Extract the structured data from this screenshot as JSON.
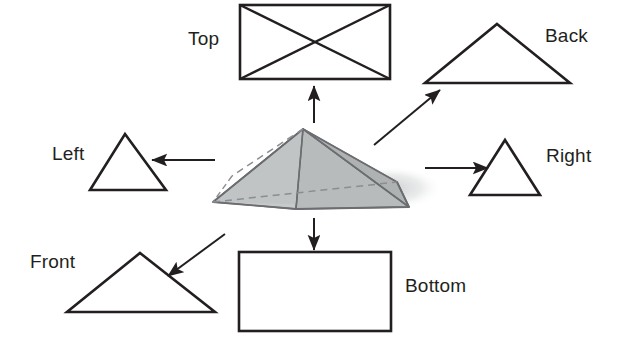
{
  "diagram": {
    "object": {
      "name": "rectangular-pyramid",
      "fill_color": "#b9bdbe",
      "fill_color_light": "#c9cdcd",
      "fill_color_dark": "#a8adae",
      "edge_color": "#58595b",
      "hidden_edge_style": "dashed",
      "shadow_color": "#d8dadb"
    },
    "line_color": "#231f20",
    "text_color": "#231f20",
    "background": "#ffffff",
    "views": [
      {
        "id": "top",
        "label": "Top",
        "shape": "rectangle-with-diagonals",
        "arrow": "up"
      },
      {
        "id": "back",
        "label": "Back",
        "shape": "triangle-wide",
        "arrow": "up-right"
      },
      {
        "id": "left",
        "label": "Left",
        "shape": "triangle-narrow",
        "arrow": "left"
      },
      {
        "id": "right",
        "label": "Right",
        "shape": "triangle-narrow",
        "arrow": "right"
      },
      {
        "id": "front",
        "label": "Front",
        "shape": "triangle-wide",
        "arrow": "down-left"
      },
      {
        "id": "bottom",
        "label": "Bottom",
        "shape": "rectangle",
        "arrow": "down"
      }
    ]
  }
}
